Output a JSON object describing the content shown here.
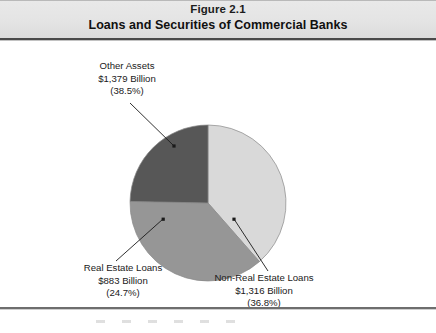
{
  "header": {
    "figure_number": "Figure 2.1",
    "title": "Loans and Securities of Commercial Banks"
  },
  "labels": {
    "other_assets": {
      "name": "Other Assets",
      "value": "$1,379 Billion",
      "percent": "(38.5%)"
    },
    "real_estate_loans": {
      "name": "Real Estate Loans",
      "value": "$883 Billion",
      "percent": "(24.7%)"
    },
    "non_real_estate_loans": {
      "name": "Non-Real Estate Loans",
      "value": "$1,316 Billion",
      "percent": "(36.8%)"
    }
  },
  "colors": {
    "other_assets": "#d9d9d9",
    "non_real_estate_loans": "#969696",
    "real_estate_loans": "#575757",
    "slice_outline": "#8a8a8a",
    "header_band": "#e4e4e4",
    "rule": "#4a4a4a",
    "text": "#1a1a1a"
  },
  "chart_data": {
    "type": "pie",
    "title": "Loans and Securities of Commercial Banks",
    "subtitle": "Figure 2.1",
    "unit": "Billions of dollars",
    "total": 3578,
    "legend": "none",
    "labels_position": "outside-with-leader-lines",
    "categories": [
      "Other Assets",
      "Non-Real Estate Loans",
      "Real Estate Loans"
    ],
    "values": [
      1379,
      1316,
      883
    ],
    "percentages": [
      38.5,
      36.8,
      24.7
    ],
    "value_labels": [
      "$1,379 Billion",
      "$1,316 Billion",
      "$883 Billion"
    ],
    "percent_labels": [
      "(38.5%)",
      "(36.8%)",
      "(24.7%)"
    ],
    "colors": [
      "#d9d9d9",
      "#969696",
      "#575757"
    ],
    "start_angle_deg": 270,
    "direction": "clockwise",
    "slices": [
      {
        "name": "Other Assets",
        "value": 1379,
        "percent": 38.5,
        "color": "#d9d9d9",
        "start_angle_deg": 270,
        "end_angle_deg": 48.6
      },
      {
        "name": "Non-Real Estate Loans",
        "value": 1316,
        "percent": 36.8,
        "color": "#969696",
        "start_angle_deg": 48.6,
        "end_angle_deg": 180
      },
      {
        "name": "Real Estate Loans",
        "value": 883,
        "percent": 24.7,
        "color": "#575757",
        "start_angle_deg": 180,
        "end_angle_deg": 270
      }
    ]
  }
}
